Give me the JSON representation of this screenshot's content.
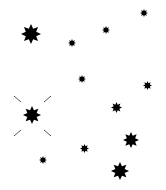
{
  "canvas": {
    "width": 166,
    "height": 190,
    "background": "#ffffff"
  },
  "star_color": "#000000",
  "sparkle_color": "#555555",
  "stars": [
    {
      "id": "star-1",
      "x": 31,
      "y": 34,
      "size": 20,
      "highlighted": false
    },
    {
      "id": "star-2",
      "x": 72,
      "y": 43,
      "size": 8,
      "highlighted": false
    },
    {
      "id": "star-3",
      "x": 106,
      "y": 30,
      "size": 8,
      "highlighted": false
    },
    {
      "id": "star-4",
      "x": 144,
      "y": 13,
      "size": 8,
      "highlighted": false
    },
    {
      "id": "star-5",
      "x": 82,
      "y": 79,
      "size": 8,
      "highlighted": false
    },
    {
      "id": "star-6",
      "x": 147,
      "y": 85,
      "size": 9,
      "highlighted": false
    },
    {
      "id": "star-7",
      "x": 32,
      "y": 115,
      "size": 18,
      "highlighted": true
    },
    {
      "id": "star-8",
      "x": 116,
      "y": 107,
      "size": 11,
      "highlighted": false
    },
    {
      "id": "star-9",
      "x": 131,
      "y": 140,
      "size": 16,
      "highlighted": false
    },
    {
      "id": "star-10",
      "x": 84,
      "y": 148,
      "size": 9,
      "highlighted": false
    },
    {
      "id": "star-11",
      "x": 43,
      "y": 160,
      "size": 8,
      "highlighted": false
    },
    {
      "id": "star-12",
      "x": 120,
      "y": 171,
      "size": 18,
      "highlighted": false
    }
  ],
  "sparkle_lines": [
    {
      "x1": 14,
      "y1": 96,
      "x2": 21,
      "y2": 102
    },
    {
      "x1": 44,
      "y1": 102,
      "x2": 51,
      "y2": 96
    },
    {
      "x1": 14,
      "y1": 136,
      "x2": 21,
      "y2": 130
    },
    {
      "x1": 44,
      "y1": 130,
      "x2": 51,
      "y2": 136
    }
  ]
}
